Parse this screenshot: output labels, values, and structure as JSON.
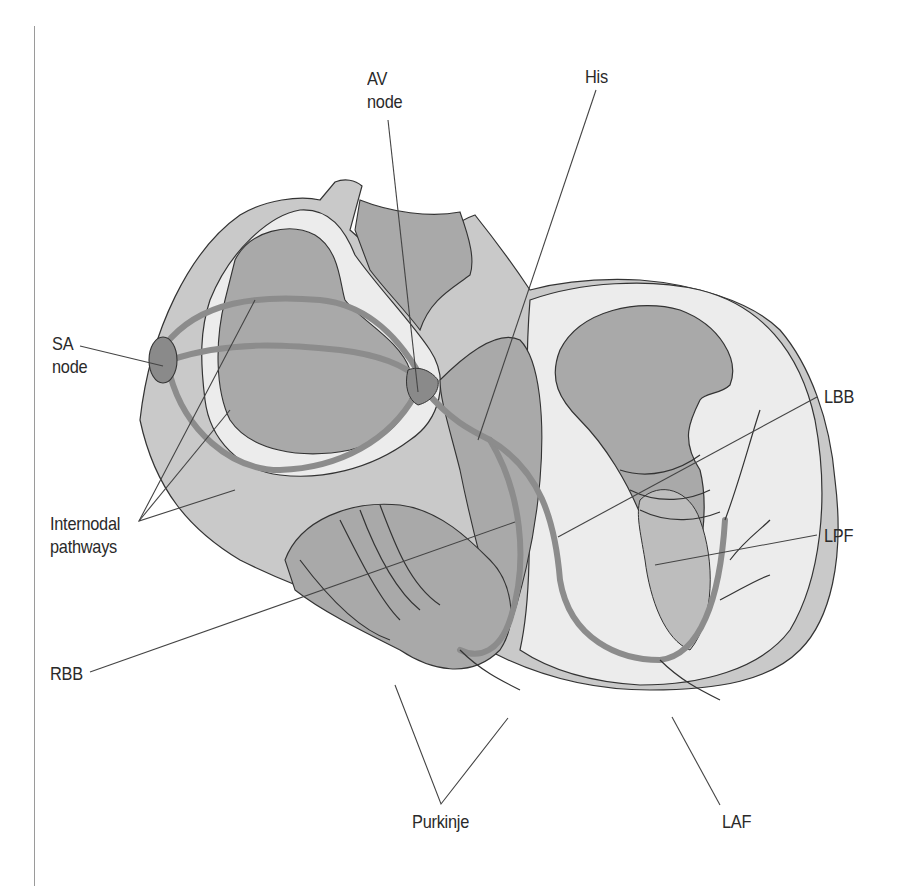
{
  "figure": {
    "colors": {
      "background": "#ffffff",
      "outline": "#333333",
      "wall_light": "#ececec",
      "wall_mid": "#c9c9c9",
      "chamber": "#a9a9a9",
      "conduction": "#8c8c8c",
      "node": "#8a8a8a",
      "leader_line": "#444444"
    },
    "labels": {
      "av_node": {
        "line1": "AV",
        "line2": "node"
      },
      "his": "His",
      "sa_node": {
        "line1": "SA",
        "line2": "node"
      },
      "lbb": "LBB",
      "internodal": {
        "line1": "Internodal",
        "line2": "pathways"
      },
      "lpf": "LPF",
      "rbb": "RBB",
      "purkinje": "Purkinje",
      "laf": "LAF"
    }
  }
}
